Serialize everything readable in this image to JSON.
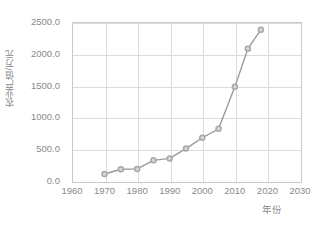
{
  "chart_data": {
    "type": "line",
    "title": "",
    "xlabel": "年份",
    "ylabel": "农业产值/万元",
    "x": [
      1970,
      1975,
      1980,
      1985,
      1990,
      1995,
      2000,
      2005,
      2010,
      2014,
      2018
    ],
    "values": [
      110,
      185,
      190,
      325,
      355,
      510,
      680,
      820,
      1480,
      2080,
      2380
    ],
    "series": [
      {
        "name": "农业产值",
        "values": [
          110,
          185,
          190,
          325,
          355,
          510,
          680,
          820,
          1480,
          2080,
          2380
        ]
      }
    ],
    "xlim": [
      1960,
      2030
    ],
    "ylim": [
      0,
      2500
    ],
    "xticks": [
      1960,
      1970,
      1980,
      1990,
      2000,
      2010,
      2020,
      2030
    ],
    "yticks": [
      0,
      500,
      1000,
      1500,
      2000,
      2500
    ],
    "xtick_labels": [
      "1960",
      "1970",
      "1980",
      "1990",
      "2000",
      "2010",
      "2020",
      "2030"
    ],
    "ytick_labels": [
      "0.0",
      "500.0",
      "1000.0",
      "1500.0",
      "2000.0",
      "2500.0"
    ],
    "grid": true,
    "legend": false,
    "legend_position": "none",
    "colors": {
      "line": "#9a9a9a",
      "marker_edge": "#a8a8a8",
      "marker_face": "#d8d8d8",
      "grid": "#dcdcdc",
      "axis": "#c9c9c9",
      "text": "#8a8a8a",
      "background": "#ffffff"
    },
    "marker": "circle-open",
    "line_width": 1.4,
    "marker_size": 5
  }
}
